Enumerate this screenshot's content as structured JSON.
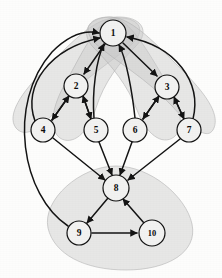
{
  "figure": {
    "type": "node-link-diagram",
    "width": 222,
    "height": 278,
    "background_color": "#fdfdfc"
  },
  "style": {
    "node_fill": "#f2f2f1",
    "node_stroke": "#121212",
    "edge_color": "#141414",
    "blob_fill": "#c9c9c9",
    "blob_stroke": "#b4b4b4",
    "label_color": "#0b0b0b"
  },
  "graph_data": {
    "type": "directed-graph",
    "node_count": 10,
    "edge_count": 21,
    "community_count": 5,
    "nodes": [
      {
        "id": "1",
        "label": "1",
        "x": 113,
        "y": 33,
        "r": 13
      },
      {
        "id": "2",
        "label": "2",
        "x": 76,
        "y": 86,
        "r": 12
      },
      {
        "id": "3",
        "label": "3",
        "x": 167,
        "y": 87,
        "r": 12
      },
      {
        "id": "4",
        "label": "4",
        "x": 43,
        "y": 130,
        "r": 12
      },
      {
        "id": "5",
        "label": "5",
        "x": 96,
        "y": 130,
        "r": 12
      },
      {
        "id": "6",
        "label": "6",
        "x": 135,
        "y": 130,
        "r": 12
      },
      {
        "id": "7",
        "label": "7",
        "x": 189,
        "y": 130,
        "r": 12
      },
      {
        "id": "8",
        "label": "8",
        "x": 116,
        "y": 188,
        "r": 13
      },
      {
        "id": "9",
        "label": "9",
        "x": 79,
        "y": 233,
        "r": 12
      },
      {
        "id": "10",
        "label": "10",
        "x": 152,
        "y": 233,
        "r": 13
      }
    ],
    "edges": [
      {
        "from": "1",
        "to": "2",
        "directed": true,
        "curved": false
      },
      {
        "from": "1",
        "to": "3",
        "directed": true,
        "curved": false
      },
      {
        "from": "2",
        "to": "4",
        "directed": true,
        "curved": false
      },
      {
        "from": "4",
        "to": "2",
        "directed": true,
        "curved": false
      },
      {
        "from": "2",
        "to": "5",
        "directed": true,
        "curved": false
      },
      {
        "from": "5",
        "to": "2",
        "directed": true,
        "curved": false
      },
      {
        "from": "3",
        "to": "6",
        "directed": true,
        "curved": false
      },
      {
        "from": "6",
        "to": "3",
        "directed": true,
        "curved": false
      },
      {
        "from": "3",
        "to": "7",
        "directed": true,
        "curved": false
      },
      {
        "from": "7",
        "to": "3",
        "directed": true,
        "curved": false
      },
      {
        "from": "4",
        "to": "1",
        "directed": true,
        "curved": true
      },
      {
        "from": "5",
        "to": "1",
        "directed": true,
        "curved": true
      },
      {
        "from": "6",
        "to": "1",
        "directed": true,
        "curved": true
      },
      {
        "from": "7",
        "to": "1",
        "directed": true,
        "curved": true
      },
      {
        "from": "9",
        "to": "1",
        "directed": true,
        "curved": true
      },
      {
        "from": "4",
        "to": "8",
        "directed": true,
        "curved": false
      },
      {
        "from": "5",
        "to": "8",
        "directed": true,
        "curved": false
      },
      {
        "from": "6",
        "to": "8",
        "directed": true,
        "curved": false
      },
      {
        "from": "7",
        "to": "8",
        "directed": true,
        "curved": false
      },
      {
        "from": "8",
        "to": "9",
        "directed": true,
        "curved": false
      },
      {
        "from": "9",
        "to": "10",
        "directed": true,
        "curved": false
      },
      {
        "from": "10",
        "to": "8",
        "directed": true,
        "curved": false
      }
    ],
    "communities": [
      {
        "id": "c1",
        "members": [
          "1",
          "2",
          "4"
        ]
      },
      {
        "id": "c2",
        "members": [
          "1",
          "2",
          "5"
        ]
      },
      {
        "id": "c3",
        "members": [
          "1",
          "3",
          "6"
        ]
      },
      {
        "id": "c4",
        "members": [
          "1",
          "3",
          "7"
        ]
      },
      {
        "id": "c5",
        "members": [
          "8",
          "9",
          "10"
        ]
      }
    ]
  }
}
